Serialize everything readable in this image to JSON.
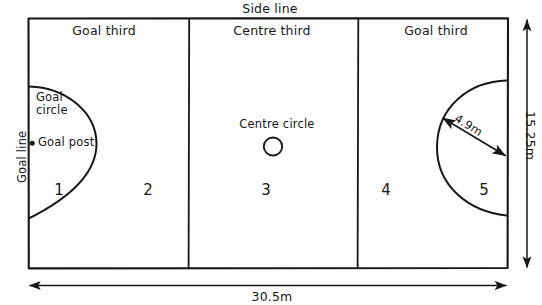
{
  "diagram": {
    "style": "hand-drawn-sketch",
    "ink_color": "#171717",
    "background_color": "#ffffff"
  },
  "court": {
    "side_line_label": "Side line",
    "goal_line_label": "Goal line",
    "thirds": [
      {
        "label": "Goal third"
      },
      {
        "label": "Centre third"
      },
      {
        "label": "Goal third"
      }
    ],
    "centre_circle_label": "Centre circle",
    "goal_circle_label_line1": "Goal",
    "goal_circle_label_line2": "circle",
    "goal_post_label": "Goal post",
    "zones": [
      {
        "number": "1"
      },
      {
        "number": "2"
      },
      {
        "number": "3"
      },
      {
        "number": "4"
      },
      {
        "number": "5"
      }
    ]
  },
  "dimensions": {
    "length": "30.5m",
    "width": "15.25m",
    "goal_circle_radius": "4.9m"
  }
}
